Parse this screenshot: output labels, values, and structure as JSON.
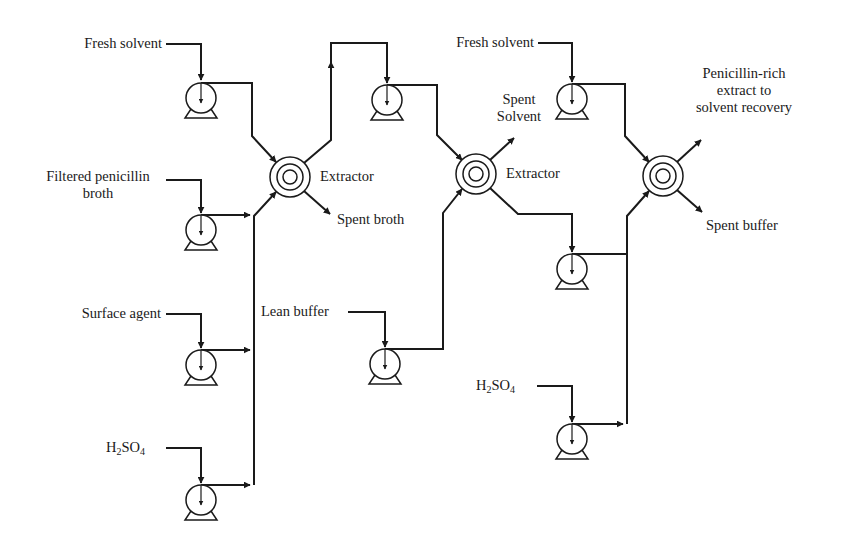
{
  "diagram": {
    "type": "process-flow",
    "colors": {
      "line": "#1a1a1a",
      "background": "#ffffff"
    },
    "labels": {
      "fresh_solvent_1": "Fresh solvent",
      "filtered_broth_line1": "Filtered penicillin",
      "filtered_broth_line2": "broth",
      "surface_agent": "Surface agent",
      "h2so4_1_main": "H",
      "h2so4_1_sub1": "2",
      "h2so4_1_mid": "SO",
      "h2so4_1_sub2": "4",
      "extractor_1": "Extractor",
      "spent_broth": "Spent broth",
      "lean_buffer": "Lean buffer",
      "spent_solvent_line1": "Spent",
      "spent_solvent_line2": "Solvent",
      "extractor_2": "Extractor",
      "fresh_solvent_2": "Fresh solvent",
      "h2so4_2_main": "H",
      "h2so4_2_sub1": "2",
      "h2so4_2_mid": "SO",
      "h2so4_2_sub2": "4",
      "penicillin_rich_line1": "Penicillin-rich",
      "penicillin_rich_line2": "extract to",
      "penicillin_rich_line3": "solvent recovery",
      "spent_buffer": "Spent buffer"
    },
    "nodes": [
      {
        "id": "pump-fresh-solvent-1",
        "kind": "pump"
      },
      {
        "id": "pump-filtered-broth",
        "kind": "pump"
      },
      {
        "id": "pump-surface-agent",
        "kind": "pump"
      },
      {
        "id": "pump-h2so4-1",
        "kind": "pump"
      },
      {
        "id": "extractor-1",
        "kind": "centrifugal-extractor"
      },
      {
        "id": "pump-solvent-transfer",
        "kind": "pump"
      },
      {
        "id": "pump-lean-buffer",
        "kind": "pump"
      },
      {
        "id": "extractor-2",
        "kind": "centrifugal-extractor"
      },
      {
        "id": "pump-fresh-solvent-2",
        "kind": "pump"
      },
      {
        "id": "pump-buffer-transfer",
        "kind": "pump"
      },
      {
        "id": "pump-h2so4-2",
        "kind": "pump"
      },
      {
        "id": "extractor-3",
        "kind": "centrifugal-extractor"
      }
    ]
  }
}
